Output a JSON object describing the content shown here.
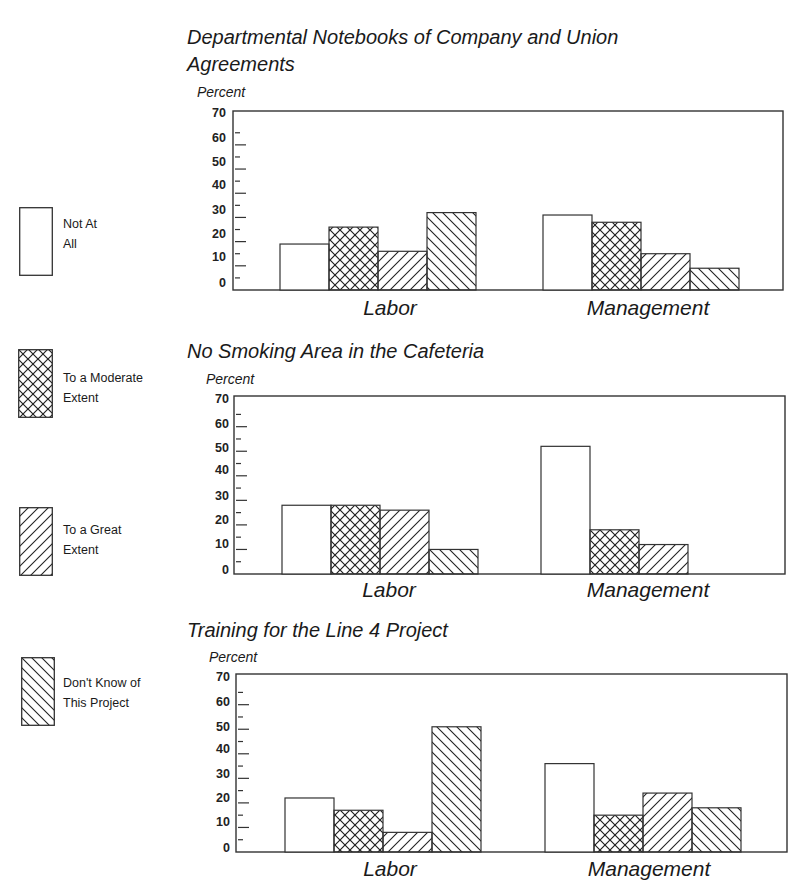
{
  "legend": {
    "items": [
      {
        "key": "not_at_all",
        "label": "Not At\nAll",
        "pattern": "none"
      },
      {
        "key": "moderate",
        "label": "To a Moderate\nExtent",
        "pattern": "crosshatch"
      },
      {
        "key": "great",
        "label": "To a Great\nExtent",
        "pattern": "forward-diagonal"
      },
      {
        "key": "dont_know",
        "label": "Don't Know of\nThis Project",
        "pattern": "backward-diagonal"
      }
    ]
  },
  "charts": [
    {
      "title_line1": "Departmental Notebooks of Company and Union",
      "title_line2": "Agreements",
      "ylabel": "Percent",
      "groups": [
        "Labor",
        "Management"
      ]
    },
    {
      "title_line1": "No Smoking Area in the Cafeteria",
      "title_line2": "",
      "ylabel": "Percent",
      "groups": [
        "Labor",
        "Management"
      ]
    },
    {
      "title_line1": "Training for the Line 4 Project",
      "title_line2": "",
      "ylabel": "Percent",
      "groups": [
        "Labor",
        "Management"
      ]
    }
  ],
  "yticks": [
    "70",
    "60",
    "50",
    "40",
    "30",
    "20",
    "10",
    "0"
  ],
  "chart_data": [
    {
      "type": "bar",
      "title": "Departmental Notebooks of Company and Union Agreements",
      "xlabel": "",
      "ylabel": "Percent",
      "ylim": [
        0,
        70
      ],
      "yticks": [
        0,
        10,
        20,
        30,
        40,
        50,
        60,
        70
      ],
      "grid": false,
      "legend_position": "left",
      "categories": [
        "Labor",
        "Management"
      ],
      "series": [
        {
          "name": "Not At All",
          "values": [
            19,
            31
          ]
        },
        {
          "name": "To a Moderate Extent",
          "values": [
            26,
            28
          ]
        },
        {
          "name": "To a Great Extent",
          "values": [
            16,
            15
          ]
        },
        {
          "name": "Don't Know of This Project",
          "values": [
            32,
            9
          ]
        }
      ]
    },
    {
      "type": "bar",
      "title": "No Smoking Area in the Cafeteria",
      "xlabel": "",
      "ylabel": "Percent",
      "ylim": [
        0,
        70
      ],
      "yticks": [
        0,
        10,
        20,
        30,
        40,
        50,
        60,
        70
      ],
      "grid": false,
      "legend_position": "left",
      "categories": [
        "Labor",
        "Management"
      ],
      "series": [
        {
          "name": "Not At All",
          "values": [
            28,
            52
          ]
        },
        {
          "name": "To a Moderate Extent",
          "values": [
            28,
            18
          ]
        },
        {
          "name": "To a Great Extent",
          "values": [
            26,
            12
          ]
        },
        {
          "name": "Don't Know of This Project",
          "values": [
            10,
            0
          ]
        }
      ]
    },
    {
      "type": "bar",
      "title": "Training for the Line 4 Project",
      "xlabel": "",
      "ylabel": "Percent",
      "ylim": [
        0,
        70
      ],
      "yticks": [
        0,
        10,
        20,
        30,
        40,
        50,
        60,
        70
      ],
      "grid": false,
      "legend_position": "left",
      "categories": [
        "Labor",
        "Management"
      ],
      "series": [
        {
          "name": "Not At All",
          "values": [
            22,
            36
          ]
        },
        {
          "name": "To a Moderate Extent",
          "values": [
            17,
            15
          ]
        },
        {
          "name": "To a Great Extent",
          "values": [
            8,
            24
          ]
        },
        {
          "name": "Don't Know of This Project",
          "values": [
            51,
            18
          ]
        }
      ]
    }
  ]
}
